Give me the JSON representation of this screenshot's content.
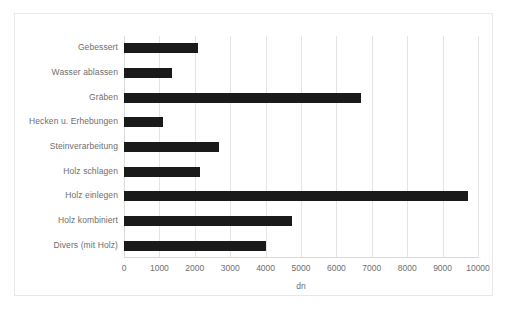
{
  "chart_data": {
    "type": "bar",
    "orientation": "horizontal",
    "title": "",
    "xlabel": "dn",
    "ylabel": "",
    "xlim": [
      0,
      10000
    ],
    "xticks": [
      0,
      1000,
      2000,
      3000,
      4000,
      5000,
      6000,
      7000,
      8000,
      9000,
      10000
    ],
    "xtick_labels": [
      "0",
      "1000",
      "2000",
      "3000",
      "4000",
      "5000",
      "6000",
      "7000",
      "8000",
      "9000",
      "10000"
    ],
    "grid": "vertical",
    "legend": "none",
    "bar_color": "#1a1a1a",
    "categories": [
      "Gebessert",
      "Wasser ablassen",
      "Gräben",
      "Hecken u. Erhebungen",
      "Steinverarbeitung",
      "Holz schlagen",
      "Holz einlegen",
      "Holz kombiniert",
      "Divers (mit Holz)"
    ],
    "values": [
      2090,
      1360,
      6700,
      1110,
      2690,
      2150,
      9720,
      4750,
      4010
    ]
  },
  "style": {
    "axis_color": "#d9d9d9",
    "grid_color": "#e4e4e4",
    "text_color": "#6e6e6e",
    "frame_color": "#e8e8e8",
    "background": "#ffffff"
  }
}
